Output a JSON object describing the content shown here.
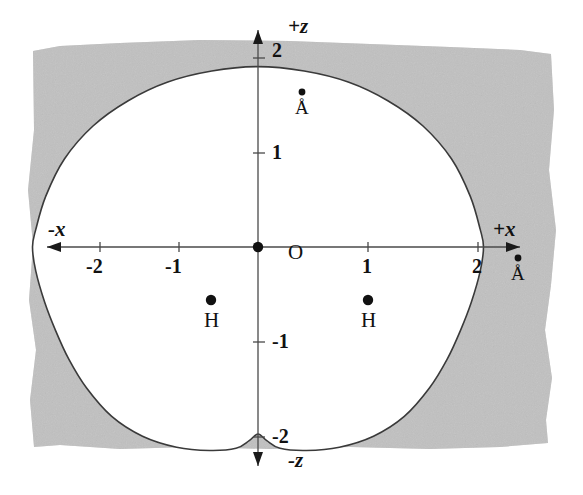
{
  "figure": {
    "background_color": "#ffffff",
    "shaded_region_color": "#c9c9c9",
    "contour_line_color": "#3a3a3a",
    "axis_color": "#4a4a4a",
    "marker_color": "#111111"
  },
  "axes": {
    "x": {
      "positive_label": "+x",
      "negative_label": "-x",
      "unit_label": "Å",
      "tick_labels": [
        "-2",
        "-1",
        "1",
        "2"
      ],
      "tick_values": [
        -2,
        -1,
        1,
        2
      ],
      "range": [
        -2.35,
        2.35
      ]
    },
    "z": {
      "positive_label": "+z",
      "negative_label": "-z",
      "unit_label": "Å",
      "tick_labels": [
        "2",
        "1",
        "-1",
        "-2"
      ],
      "tick_values": [
        2,
        1,
        -1,
        -2
      ],
      "range": [
        -2.35,
        2.35
      ]
    }
  },
  "atoms": [
    {
      "symbol": "O",
      "x": 0.0,
      "z": 0.0
    },
    {
      "symbol": "H",
      "x": -0.76,
      "z": -0.58
    },
    {
      "symbol": "H",
      "x": 0.76,
      "z": -0.58
    }
  ],
  "chart_data": {
    "type": "line",
    "xlabel": "+x",
    "ylabel": "+z",
    "xlim": [
      -2.35,
      2.35
    ],
    "ylim": [
      -2.35,
      2.35
    ],
    "grid": false,
    "legend": null,
    "x_ticks": [
      -2,
      -1,
      1,
      2
    ],
    "y_ticks": [
      -2,
      -1,
      1,
      2
    ],
    "units": "Å",
    "series": [
      {
        "name": "electron density isosurface contour",
        "closed": true,
        "x": [
          0.0,
          0.42,
          0.82,
          1.18,
          1.5,
          1.76,
          1.93,
          2.02,
          2.05,
          2.02,
          1.94,
          1.84,
          1.72,
          1.56,
          1.33,
          1.05,
          0.74,
          0.44,
          0.2,
          0.08,
          0.0,
          -0.08,
          -0.2,
          -0.44,
          -0.74,
          -1.05,
          -1.33,
          -1.56,
          -1.72,
          -1.84,
          -1.94,
          -2.02,
          -2.05,
          -2.02,
          -1.93,
          -1.76,
          -1.5,
          -1.18,
          -0.82,
          -0.42
        ],
        "z": [
          1.64,
          1.6,
          1.5,
          1.33,
          1.1,
          0.8,
          0.46,
          0.16,
          0.0,
          -0.22,
          -0.5,
          -0.76,
          -1.02,
          -1.28,
          -1.54,
          -1.72,
          -1.82,
          -1.85,
          -1.83,
          -1.76,
          -1.7,
          -1.76,
          -1.83,
          -1.85,
          -1.82,
          -1.72,
          -1.54,
          -1.28,
          -1.02,
          -0.76,
          -0.5,
          -0.22,
          0.0,
          0.16,
          0.46,
          0.8,
          1.1,
          1.33,
          1.5,
          1.6
        ]
      }
    ],
    "annotations": [
      {
        "text": "O",
        "x": 0.0,
        "z": 0.0,
        "kind": "atom-marker"
      },
      {
        "text": "H",
        "x": -0.76,
        "z": -0.58,
        "kind": "atom-marker"
      },
      {
        "text": "H",
        "x": 0.76,
        "z": -0.58,
        "kind": "atom-marker"
      },
      {
        "text": "Å",
        "x": 0.0,
        "z": 1.45,
        "kind": "unit-marker"
      },
      {
        "text": "Å",
        "x": 2.32,
        "z": -0.22,
        "kind": "unit-marker"
      }
    ]
  }
}
